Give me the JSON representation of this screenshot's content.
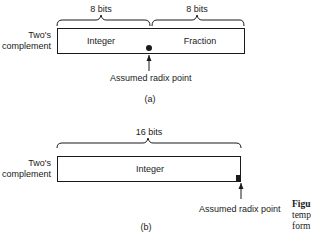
{
  "figure": {
    "part_a": {
      "row_label_line1": "Two's",
      "row_label_line2": "complement",
      "brace_left_label": "8 bits",
      "brace_right_label": "8 bits",
      "field_left": "Integer",
      "field_right": "Fraction",
      "radix_label": "Assumed radix point",
      "tag": "(a)"
    },
    "part_b": {
      "row_label_line1": "Two's",
      "row_label_line2": "complement",
      "brace_label": "16 bits",
      "field": "Integer",
      "radix_label": "Assumed radix point",
      "tag": "(b)"
    },
    "caption": {
      "line1": "Figu",
      "line2": "temp",
      "line3": "form"
    }
  }
}
